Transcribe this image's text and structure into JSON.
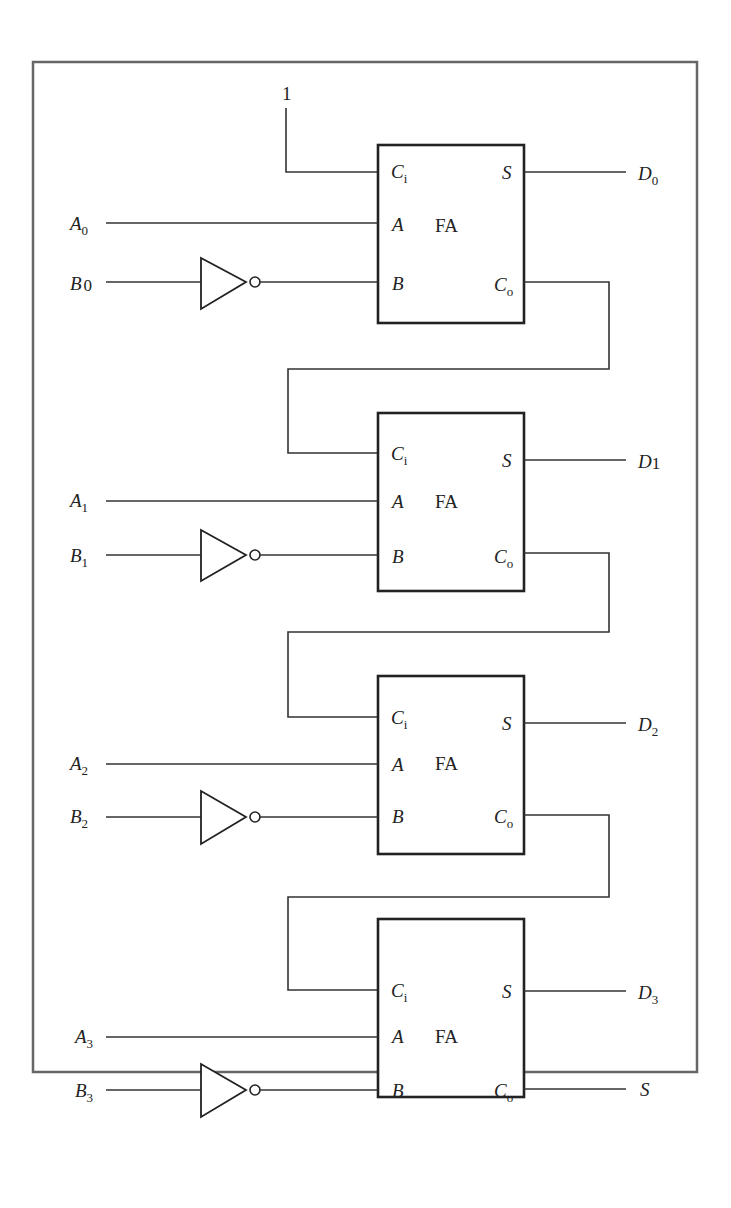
{
  "diagram": {
    "carry_in_constant": "1",
    "block_label": "FA",
    "pins": {
      "ci": "C",
      "ci_sub": "i",
      "a": "A",
      "b": "B",
      "s": "S",
      "co": "C",
      "co_sub": "o"
    },
    "stages": [
      {
        "a_label": "A",
        "a_sub": "0",
        "b_label": "B",
        "b_sub": "0",
        "out_label": "D",
        "out_sub": "0"
      },
      {
        "a_label": "A",
        "a_sub": "1",
        "b_label": "B",
        "b_sub": "1",
        "out_label": "D",
        "out_sub": "1"
      },
      {
        "a_label": "A",
        "a_sub": "2",
        "b_label": "B",
        "b_sub": "2",
        "out_label": "D",
        "out_sub": "2"
      },
      {
        "a_label": "A",
        "a_sub": "3",
        "b_label": "B",
        "b_sub": "3",
        "out_label": "D",
        "out_sub": "3"
      }
    ],
    "final_carry_label": "S"
  }
}
